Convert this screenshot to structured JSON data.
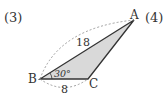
{
  "problems": {
    "left_number": "(3)",
    "right_number": "(4)"
  },
  "triangle": {
    "vertices": {
      "A": "A",
      "B": "B",
      "C": "C"
    },
    "side_AB": "18",
    "side_BC": "8",
    "angle_B": "30°",
    "fill_color": "#d9d9d9",
    "stroke_color": "#333333"
  }
}
